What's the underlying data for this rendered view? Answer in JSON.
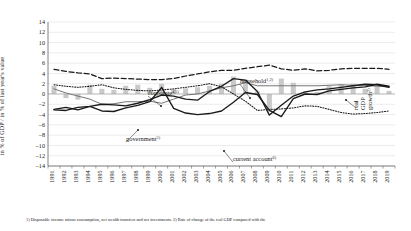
{
  "axis": {
    "y_label": "in % of GDP / in % of last year's value",
    "y_ticks": [
      14,
      12,
      10,
      8,
      6,
      4,
      2,
      0,
      -2,
      -4,
      -6,
      -8,
      -10,
      -12,
      -14
    ],
    "x_ticks": [
      1991,
      1992,
      1993,
      1994,
      1995,
      1996,
      1997,
      1998,
      1999,
      2000,
      2001,
      2002,
      2003,
      2004,
      2005,
      2006,
      2007,
      2008,
      2009,
      2010,
      2011,
      2012,
      2013,
      2014,
      2015,
      2016,
      2017,
      2018,
      2019
    ]
  },
  "annotations": {
    "household": {
      "label": "household",
      "sup": "1,2)"
    },
    "corporate": {
      "label": "corporate",
      "sup": "4,5)"
    },
    "government": {
      "label": "government",
      "sup": "5)"
    },
    "current_account": {
      "label": "current account",
      "sup": "6)"
    },
    "real_gdp_growth": {
      "line1": "real",
      "line2": "GDP",
      "line3": "growth",
      "sup": "2)"
    }
  },
  "footnotes": {
    "text": "1) Disposable income minus consumption, net wealth transfers and net investments. 2) Rate of change of the real GDP compared with the"
  },
  "colors": {
    "household": "#1a1a1a",
    "corporate": "#6e6e6e",
    "government": "#1a1a1a",
    "current_account": "#1a1a1a",
    "real_gdp": "#1a1a1a",
    "bars": "#c9c9c9",
    "grid": "#d9d9d9",
    "axis": "#4d4d4d"
  },
  "chart_data": {
    "type": "line",
    "title": "",
    "xlabel": "",
    "ylabel": "in % of GDP / in % of last year's value",
    "ylim": [
      -14,
      14
    ],
    "grid": true,
    "legend": "inline-annotations",
    "x": [
      1991,
      1992,
      1993,
      1994,
      1995,
      1996,
      1997,
      1998,
      1999,
      2000,
      2001,
      2002,
      2003,
      2004,
      2005,
      2006,
      2007,
      2008,
      2009,
      2010,
      2011,
      2012,
      2013,
      2014,
      2015,
      2016,
      2017,
      2018,
      2019
    ],
    "series": [
      {
        "name": "household",
        "style": "dashed",
        "values": [
          4.8,
          4.4,
          4.1,
          3.9,
          3.0,
          3.1,
          3.0,
          2.9,
          2.8,
          2.8,
          3.0,
          3.5,
          3.9,
          4.3,
          4.6,
          4.6,
          5.0,
          5.3,
          5.6,
          4.9,
          4.6,
          4.9,
          4.5,
          4.6,
          4.9,
          5.0,
          5.0,
          5.0,
          4.8
        ]
      },
      {
        "name": "corporate",
        "style": "solid-thin-gray",
        "values": [
          1.0,
          0.2,
          -0.4,
          -1.0,
          -2.0,
          -1.9,
          -1.5,
          -1.5,
          -1.4,
          -1.8,
          -1.0,
          -0.2,
          0.0,
          0.6,
          1.2,
          1.6,
          2.2,
          1.6,
          1.6,
          1.6,
          1.6,
          1.6,
          1.6,
          1.7,
          1.8,
          1.7,
          1.7,
          1.5,
          1.4
        ]
      },
      {
        "name": "government",
        "style": "solid-bold",
        "values": [
          -3.0,
          -2.6,
          -3.1,
          -2.4,
          -3.3,
          -3.4,
          -2.7,
          -2.2,
          -1.5,
          1.3,
          -2.8,
          -3.7,
          -4.0,
          -3.8,
          -3.3,
          -1.6,
          0.3,
          -0.1,
          -3.2,
          -4.4,
          -0.9,
          0.0,
          -0.1,
          0.6,
          0.9,
          1.2,
          1.4,
          1.9,
          1.5
        ]
      },
      {
        "name": "current account",
        "style": "dotted",
        "values": [
          1.8,
          1.5,
          1.3,
          1.5,
          1.8,
          1.2,
          0.9,
          0.7,
          0.6,
          0.8,
          1.0,
          1.3,
          1.6,
          2.0,
          1.4,
          0.0,
          -1.4,
          -3.2,
          -3.0,
          -2.9,
          -2.7,
          -2.3,
          -2.4,
          -3.0,
          -3.6,
          -3.9,
          -3.8,
          -3.6,
          -3.3
        ]
      },
      {
        "name": "real GDP growth",
        "style": "solid-bold-dark",
        "values": [
          -3.1,
          -3.2,
          -2.6,
          -2.4,
          -2.0,
          -2.1,
          -2.3,
          -1.8,
          -1.1,
          -0.2,
          -0.4,
          -1.0,
          -1.2,
          0.5,
          1.5,
          3.0,
          2.7,
          0.5,
          -4.1,
          -2.2,
          -0.4,
          0.4,
          0.8,
          1.0,
          1.3,
          1.6,
          1.9,
          1.8,
          1.3
        ]
      }
    ],
    "bars": {
      "name": "annual bars",
      "values": [
        1.6,
        -0.8,
        -1.1,
        1.8,
        1.0,
        0.8,
        1.6,
        1.8,
        1.2,
        2.0,
        0.9,
        1.1,
        1.3,
        1.6,
        2.0,
        3.4,
        2.8,
        0.5,
        -3.4,
        3.0,
        2.2,
        0.5,
        0.4,
        1.6,
        1.9,
        2.0,
        1.0,
        1.4,
        0.6
      ]
    }
  }
}
